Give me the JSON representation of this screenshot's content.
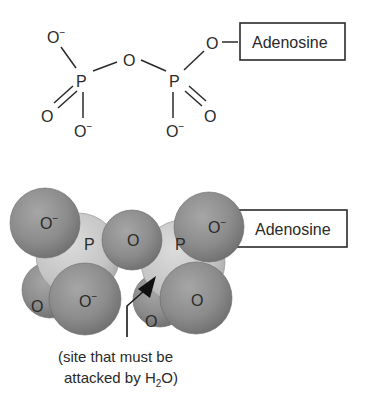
{
  "structural_formula": {
    "atoms": {
      "o_top_left": "O",
      "p_left": "P",
      "o_bridge": "O",
      "p_right": "P",
      "o_ester": "O",
      "o_double_left": "O",
      "o_minus_left": "O",
      "o_minus_right": "O",
      "o_double_right": "O"
    },
    "charge": "−",
    "group_label": "Adenosine"
  },
  "space_filling_model": {
    "atoms": {
      "o_minus_top_left": "O",
      "p_left": "P",
      "o_bridge": "O",
      "p_right": "P",
      "o_minus_top_right": "O",
      "o_bottom_left": "O",
      "o_minus_bottom_left": "O",
      "o_bottom_mid": "O",
      "o_bottom_right": "O"
    },
    "charge": "−",
    "group_label": "Adenosine",
    "caption_line1": "(site that must be",
    "caption_line2_prefix": "attacked by H",
    "caption_subscript": "2",
    "caption_line2_suffix": "O)"
  },
  "colors": {
    "oxygen_sphere": "#8a8a8a",
    "phosphorus_sphere": "#c8c8c8",
    "line": "#2a2a2a"
  }
}
